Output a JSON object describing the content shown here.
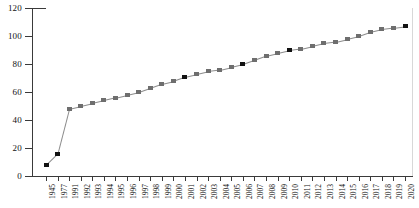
{
  "chart_data": {
    "type": "line",
    "title": "",
    "subtitle": "",
    "xlabel": "",
    "ylabel": "",
    "ylim": [
      0,
      120
    ],
    "yticks": [
      0,
      20,
      40,
      60,
      80,
      100,
      120
    ],
    "grid": false,
    "legend": false,
    "marker": "square",
    "line_color": "#8d8d8d",
    "marker_color": "#6e6e6e",
    "marker_color_emphasis": "#121212",
    "categories": [
      "1945",
      "1977",
      "1991",
      "1992",
      "1993",
      "1994",
      "1995",
      "1996",
      "1997",
      "1998",
      "1999",
      "2000",
      "2001",
      "2002",
      "2003",
      "2004",
      "2005",
      "2006",
      "2007",
      "2008",
      "2009",
      "2010",
      "2011",
      "2012",
      "2013",
      "2014",
      "2015",
      "2016",
      "2017",
      "2018",
      "2019",
      "2020"
    ],
    "values": [
      8,
      16,
      48,
      50,
      52,
      54,
      56,
      58,
      60,
      63,
      66,
      68,
      71,
      73,
      75,
      76,
      78,
      80,
      83,
      86,
      88,
      90,
      91,
      93,
      95,
      96,
      98,
      100,
      103,
      105,
      106,
      107
    ],
    "emphasis_indices": [
      0,
      1,
      12,
      17,
      21,
      31
    ]
  }
}
